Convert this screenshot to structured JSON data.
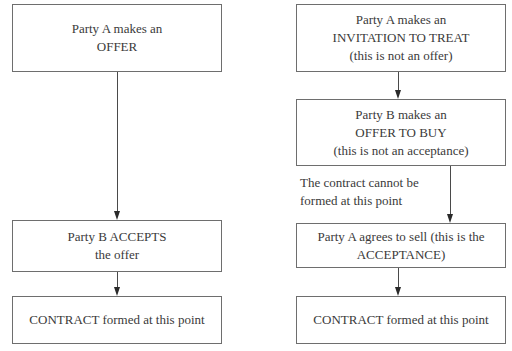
{
  "left_flow": {
    "box1": {
      "line1": "Party A makes an",
      "line2": "OFFER"
    },
    "box2": {
      "line1": "Party B ACCEPTS",
      "line2": "the offer"
    },
    "box3": {
      "line1": "CONTRACT formed at this point"
    }
  },
  "right_flow": {
    "box1": {
      "line1": "Party A makes an",
      "line2": "INVITATION TO TREAT",
      "line3": "(this is not an offer)"
    },
    "box2": {
      "line1": "Party B makes an",
      "line2": "OFFER TO BUY",
      "line3": "(this is not an acceptance)"
    },
    "note": {
      "line1": "The contract cannot be",
      "line2": "formed at this point"
    },
    "box3": {
      "line1": "Party A agrees to sell (this is the",
      "line2": "ACCEPTANCE)"
    },
    "box4": {
      "line1": "CONTRACT formed at this point"
    }
  }
}
